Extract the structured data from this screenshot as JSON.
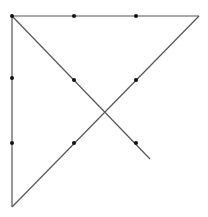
{
  "diagram": {
    "width": 208,
    "height": 217,
    "line_color": "#555555",
    "point_color": "#111111",
    "lines": [
      {
        "name": "top-edge",
        "x1": 12,
        "y1": 16,
        "x2": 199,
        "y2": 16
      },
      {
        "name": "left-edge",
        "x1": 12,
        "y1": 16,
        "x2": 12,
        "y2": 207
      },
      {
        "name": "diagonal-descending",
        "x1": 12,
        "y1": 16,
        "x2": 150,
        "y2": 159
      },
      {
        "name": "diagonal-ascending",
        "x1": 199,
        "y1": 16,
        "x2": 12,
        "y2": 207
      }
    ],
    "points": [
      {
        "x": 12,
        "y": 16
      },
      {
        "x": 74,
        "y": 16
      },
      {
        "x": 136,
        "y": 16
      },
      {
        "x": 12,
        "y": 78
      },
      {
        "x": 12,
        "y": 143
      },
      {
        "x": 74,
        "y": 80
      },
      {
        "x": 136,
        "y": 80
      },
      {
        "x": 74,
        "y": 143
      },
      {
        "x": 136,
        "y": 143
      }
    ]
  }
}
